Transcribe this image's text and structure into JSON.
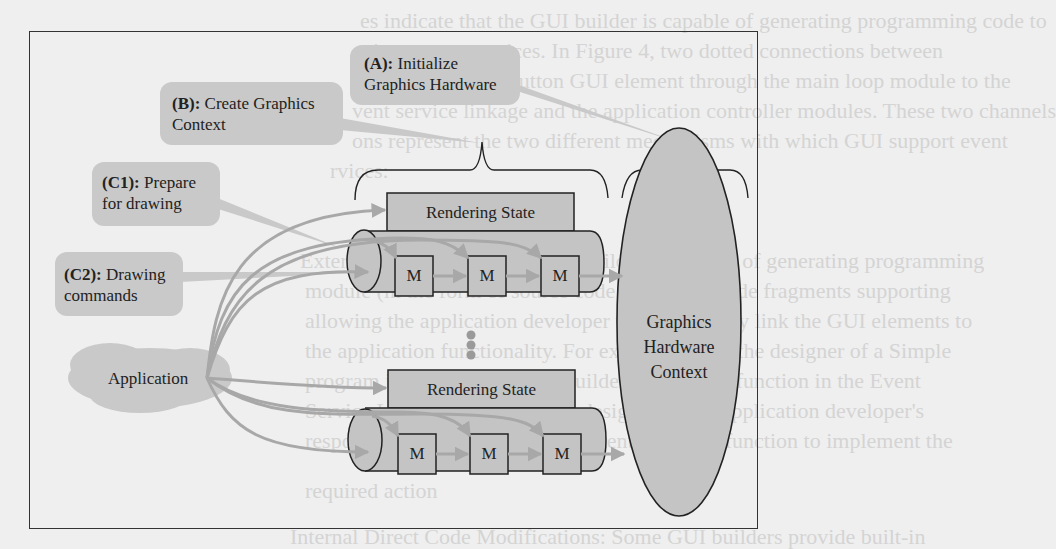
{
  "diagram": {
    "callouts": {
      "a": {
        "tag": "(A):",
        "line1": "Initialize",
        "line2": "Graphics Hardware"
      },
      "b": {
        "tag": "(B):",
        "line1": "Create Graphics",
        "line2": "Context"
      },
      "c1": {
        "tag": "(C1):",
        "line1": "Prepare",
        "line2": "for drawing"
      },
      "c2": {
        "tag": "(C2):",
        "line1": "Drawing",
        "line2": "commands"
      }
    },
    "application": {
      "label": "Application"
    },
    "pipelines": [
      {
        "state_label": "Rendering State",
        "modules": [
          "M",
          "M",
          "M"
        ]
      },
      {
        "state_label": "Rendering State",
        "modules": [
          "M",
          "M",
          "M"
        ]
      }
    ],
    "context": {
      "line1": "Graphics",
      "line2": "Hardware",
      "line3": "Context"
    },
    "colors": {
      "background": "#efefef",
      "callout_fill": "#c9c9c9",
      "shape_fill": "#c4c4c4",
      "arrow": "#a8a8a8",
      "stroke": "#222222"
    }
  },
  "bleed_through_text": [
    "es indicate that the GUI builder is capable of generating programming code to",
    "gister event services. In Figure 4, two dotted connections between",
    "e mouse and the button GUI element through the main loop module to the",
    "vent service linkage and the application controller modules. These two channels",
    "ons represent the two different mechanisms with which GUI support event",
    "rvices:",
    "External Source Code: the GUI builder is capable of generating programming",
    "module (in the form of source code files) with code fragments supporting",
    "allowing the application developer to semantically link the GUI elements to",
    "the application functionality. For example, when the designer of a Simple",
    "program is finished, the GUI builder generates a function in the Event",
    "Service Linkage module of the design. It is the application developer's",
    "responsibility to insert code fragments into this function to implement the",
    "required action",
    "Internal Direct Code Modifications: Some GUI builders provide built-in"
  ]
}
